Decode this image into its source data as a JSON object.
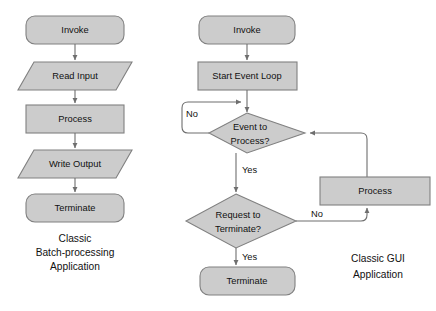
{
  "diagram": {
    "background_color": "#ffffff",
    "shape_fill_color": "#cccccc",
    "shape_border_color": "#808080",
    "edge_color": "#6e6e6e",
    "text_color": "#111111"
  },
  "left_flow": {
    "caption": {
      "line1": "Classic",
      "line2": "Batch-processing",
      "line3": "Application"
    },
    "nodes": [
      {
        "id": "l-invoke",
        "label": "Invoke",
        "shape": "rounded-rectangle"
      },
      {
        "id": "l-read-input",
        "label": "Read Input",
        "shape": "parallelogram"
      },
      {
        "id": "l-process",
        "label": "Process",
        "shape": "rectangle"
      },
      {
        "id": "l-write-output",
        "label": "Write Output",
        "shape": "parallelogram"
      },
      {
        "id": "l-terminate",
        "label": "Terminate",
        "shape": "rounded-rectangle"
      }
    ],
    "edges": [
      {
        "from": "l-invoke",
        "to": "l-read-input",
        "label": ""
      },
      {
        "from": "l-read-input",
        "to": "l-process",
        "label": ""
      },
      {
        "from": "l-process",
        "to": "l-write-output",
        "label": ""
      },
      {
        "from": "l-write-output",
        "to": "l-terminate",
        "label": ""
      }
    ]
  },
  "right_flow": {
    "caption": {
      "line1": "Classic GUI",
      "line2": "Application"
    },
    "nodes": [
      {
        "id": "r-invoke",
        "label": "Invoke",
        "shape": "rounded-rectangle"
      },
      {
        "id": "r-start-event-loop",
        "label": "Start Event Loop",
        "shape": "rectangle"
      },
      {
        "id": "r-event-decision-line1",
        "label": "Event to",
        "shape": "diamond"
      },
      {
        "id": "r-event-decision-line2",
        "label": "Process?",
        "shape": "diamond"
      },
      {
        "id": "r-process",
        "label": "Process",
        "shape": "rectangle"
      },
      {
        "id": "r-terminate-decision-line1",
        "label": "Request to",
        "shape": "diamond"
      },
      {
        "id": "r-terminate-decision-line2",
        "label": "Terminate?",
        "shape": "diamond"
      },
      {
        "id": "r-terminate",
        "label": "Terminate",
        "shape": "rounded-rectangle"
      }
    ],
    "edges": [
      {
        "from": "r-invoke",
        "to": "r-start-event-loop",
        "label": ""
      },
      {
        "from": "r-start-event-loop",
        "to": "r-event-decision",
        "label": ""
      },
      {
        "from": "r-event-decision",
        "to": "r-event-decision",
        "label": "No"
      },
      {
        "from": "r-event-decision",
        "to": "r-terminate-decision",
        "label": "Yes"
      },
      {
        "from": "r-terminate-decision",
        "to": "r-process",
        "label": "No"
      },
      {
        "from": "r-terminate-decision",
        "to": "r-terminate",
        "label": "Yes"
      },
      {
        "from": "r-process",
        "to": "r-event-decision",
        "label": ""
      }
    ],
    "edge_labels": {
      "event_no": "No",
      "event_yes": "Yes",
      "terminate_no": "No",
      "terminate_yes": "Yes"
    }
  }
}
